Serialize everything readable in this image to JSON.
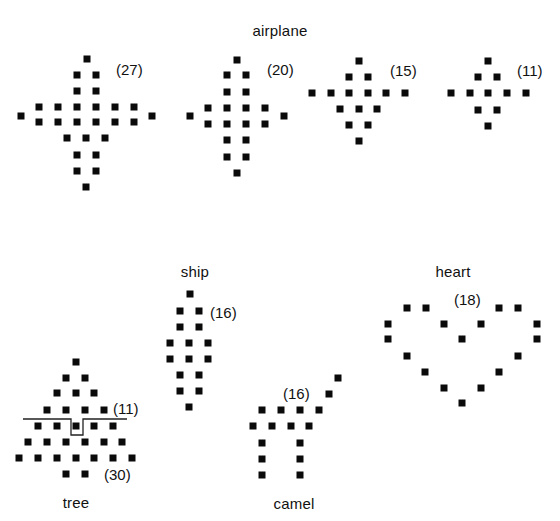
{
  "figure": {
    "groups": [
      {
        "id": "airplane",
        "title": "airplane",
        "title_pos": [
          280,
          30
        ],
        "figures": [
          {
            "id": "airplane-27",
            "count_label": "(27)",
            "count_pos": [
              116,
              69
            ],
            "dots": [
              [
                87,
                59
              ],
              [
                77,
                75
              ],
              [
                96,
                75
              ],
              [
                77,
                91
              ],
              [
                96,
                91
              ],
              [
                39,
                107
              ],
              [
                58,
                107
              ],
              [
                77,
                107
              ],
              [
                96,
                107
              ],
              [
                115,
                107
              ],
              [
                134,
                107
              ],
              [
                21,
                116
              ],
              [
                152,
                116
              ],
              [
                39,
                122
              ],
              [
                58,
                122
              ],
              [
                77,
                122
              ],
              [
                96,
                122
              ],
              [
                115,
                122
              ],
              [
                134,
                122
              ],
              [
                67,
                138
              ],
              [
                86,
                138
              ],
              [
                105,
                138
              ],
              [
                77,
                155
              ],
              [
                96,
                155
              ],
              [
                77,
                171
              ],
              [
                96,
                171
              ],
              [
                86,
                187
              ]
            ]
          },
          {
            "id": "airplane-20",
            "count_label": "(20)",
            "count_pos": [
              267,
              69
            ],
            "dots": [
              [
                237,
                60
              ],
              [
                227,
                75
              ],
              [
                246,
                75
              ],
              [
                227,
                92
              ],
              [
                246,
                92
              ],
              [
                208,
                108
              ],
              [
                227,
                108
              ],
              [
                246,
                108
              ],
              [
                265,
                108
              ],
              [
                190,
                116
              ],
              [
                284,
                116
              ],
              [
                208,
                124
              ],
              [
                227,
                124
              ],
              [
                246,
                124
              ],
              [
                265,
                124
              ],
              [
                227,
                140
              ],
              [
                246,
                140
              ],
              [
                227,
                157
              ],
              [
                246,
                157
              ],
              [
                237,
                173
              ]
            ]
          },
          {
            "id": "airplane-15",
            "count_label": "(15)",
            "count_pos": [
              390,
              70
            ],
            "dots": [
              [
                359,
                61
              ],
              [
                349,
                77
              ],
              [
                368,
                77
              ],
              [
                312,
                93
              ],
              [
                331,
                93
              ],
              [
                349,
                93
              ],
              [
                368,
                93
              ],
              [
                386,
                93
              ],
              [
                405,
                93
              ],
              [
                340,
                109
              ],
              [
                359,
                109
              ],
              [
                377,
                109
              ],
              [
                349,
                125
              ],
              [
                368,
                125
              ],
              [
                359,
                141
              ]
            ]
          },
          {
            "id": "airplane-11",
            "count_label": "(11)",
            "count_pos": [
              517,
              70
            ],
            "dots": [
              [
                488,
                61
              ],
              [
                478,
                77
              ],
              [
                497,
                77
              ],
              [
                451,
                93
              ],
              [
                470,
                93
              ],
              [
                488,
                93
              ],
              [
                507,
                93
              ],
              [
                526,
                93
              ],
              [
                478,
                110
              ],
              [
                497,
                110
              ],
              [
                488,
                126
              ]
            ]
          }
        ]
      },
      {
        "id": "ship",
        "title": "ship",
        "title_pos": [
          195,
          271
        ],
        "figures": [
          {
            "id": "ship-16",
            "count_label": "(16)",
            "count_pos": [
              210,
              312
            ],
            "dots": [
              [
                190,
                294
              ],
              [
                180,
                311
              ],
              [
                199,
                311
              ],
              [
                180,
                327
              ],
              [
                199,
                327
              ],
              [
                170,
                343
              ],
              [
                189,
                343
              ],
              [
                208,
                343
              ],
              [
                170,
                359
              ],
              [
                189,
                359
              ],
              [
                208,
                359
              ],
              [
                180,
                375
              ],
              [
                199,
                375
              ],
              [
                180,
                391
              ],
              [
                199,
                391
              ],
              [
                189,
                407
              ]
            ]
          }
        ]
      },
      {
        "id": "heart",
        "title": "heart",
        "title_pos": [
          453,
          271
        ],
        "figures": [
          {
            "id": "heart-18",
            "count_label": "(18)",
            "count_pos": [
              454,
              299
            ],
            "dots": [
              [
                407,
                308
              ],
              [
                426,
                308
              ],
              [
                499,
                308
              ],
              [
                518,
                308
              ],
              [
                388,
                324
              ],
              [
                444,
                324
              ],
              [
                481,
                324
              ],
              [
                537,
                324
              ],
              [
                388,
                339
              ],
              [
                462,
                339
              ],
              [
                537,
                339
              ],
              [
                407,
                356
              ],
              [
                518,
                356
              ],
              [
                425,
                372
              ],
              [
                499,
                372
              ],
              [
                444,
                388
              ],
              [
                481,
                388
              ],
              [
                462,
                403
              ]
            ]
          }
        ]
      },
      {
        "id": "tree",
        "title": "tree",
        "title_pos": [
          76,
          502
        ],
        "figures": [
          {
            "id": "tree-30",
            "count_label": "(30)",
            "count_pos": [
              104,
              474
            ],
            "sub_count_label": "(11)",
            "sub_count_pos": [
              113,
              408
            ],
            "divider": {
              "path": "M23,419 L71,419 L71,435 L83,435 L83,419 L127,419",
              "stroke": "#222222"
            },
            "dots": [
              [
                76,
                362
              ],
              [
                66,
                378
              ],
              [
                85,
                378
              ],
              [
                57,
                393
              ],
              [
                76,
                393
              ],
              [
                94,
                393
              ],
              [
                47,
                410
              ],
              [
                66,
                410
              ],
              [
                85,
                410
              ],
              [
                104,
                410
              ],
              [
                38,
                426
              ],
              [
                57,
                426
              ],
              [
                76,
                426
              ],
              [
                94,
                426
              ],
              [
                113,
                426
              ],
              [
                28,
                442
              ],
              [
                47,
                442
              ],
              [
                66,
                442
              ],
              [
                85,
                442
              ],
              [
                104,
                442
              ],
              [
                122,
                442
              ],
              [
                19,
                458
              ],
              [
                38,
                458
              ],
              [
                57,
                458
              ],
              [
                76,
                458
              ],
              [
                94,
                458
              ],
              [
                113,
                458
              ],
              [
                132,
                458
              ],
              [
                66,
                474
              ],
              [
                85,
                474
              ]
            ]
          }
        ]
      },
      {
        "id": "camel",
        "title": "camel",
        "title_pos": [
          294,
          503
        ],
        "figures": [
          {
            "id": "camel-16",
            "count_label": "(16)",
            "count_pos": [
              283,
              393
            ],
            "dots": [
              [
                338,
                378
              ],
              [
                329,
                394
              ],
              [
                262,
                410
              ],
              [
                281,
                410
              ],
              [
                300,
                410
              ],
              [
                319,
                410
              ],
              [
                253,
                426
              ],
              [
                272,
                426
              ],
              [
                291,
                426
              ],
              [
                309,
                426
              ],
              [
                262,
                443
              ],
              [
                300,
                443
              ],
              [
                262,
                459
              ],
              [
                300,
                459
              ],
              [
                262,
                475
              ],
              [
                300,
                475
              ]
            ]
          }
        ]
      }
    ],
    "colors": {
      "background": "#ffffff",
      "dot": "#0a0a0a",
      "text": "#111111"
    }
  }
}
